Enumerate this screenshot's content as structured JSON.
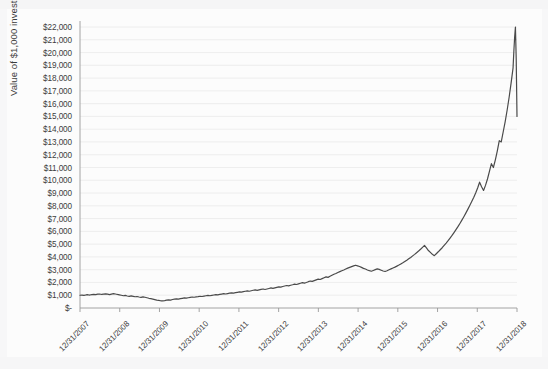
{
  "chart_data": {
    "type": "line",
    "title": "",
    "xlabel": "",
    "ylabel": "Value of $1,000 investment",
    "ylim": [
      0,
      22000
    ],
    "grid": true,
    "legend": false,
    "y_tick_labels": [
      "$22,000",
      "$21,000",
      "$20,000",
      "$19,000",
      "$18,000",
      "$17,000",
      "$16,000",
      "$15,000",
      "$14,000",
      "$13,000",
      "$12,000",
      "$11,000",
      "$10,000",
      "$9,000",
      "$8,000",
      "$7,000",
      "$6,000",
      "$5,000",
      "$4,000",
      "$3,000",
      "$2,000",
      "$1,000",
      "$-"
    ],
    "y_tick_values": [
      22000,
      21000,
      20000,
      19000,
      18000,
      17000,
      16000,
      15000,
      14000,
      13000,
      12000,
      11000,
      10000,
      9000,
      8000,
      7000,
      6000,
      5000,
      4000,
      3000,
      2000,
      1000,
      0
    ],
    "x_tick_labels": [
      "12/31/2007",
      "12/31/2008",
      "12/31/2009",
      "12/31/2010",
      "12/31/2011",
      "12/31/2012",
      "12/31/2013",
      "12/31/2014",
      "12/31/2015",
      "12/31/2016",
      "12/31/2017",
      "12/31/2018"
    ],
    "x_start": 2007.0,
    "x_end": 2018.1,
    "series_name": "Value of $1,000 investment",
    "line_color": "#4a4a4a",
    "line_width": 1.2,
    "x": [
      2007.0,
      2007.05,
      2007.1,
      2007.15,
      2007.2,
      2007.25,
      2007.3,
      2007.35,
      2007.4,
      2007.45,
      2007.5,
      2007.55,
      2007.6,
      2007.65,
      2007.7,
      2007.75,
      2007.8,
      2007.85,
      2007.9,
      2007.95,
      2008.0,
      2008.05,
      2008.1,
      2008.15,
      2008.2,
      2008.25,
      2008.3,
      2008.35,
      2008.4,
      2008.45,
      2008.5,
      2008.55,
      2008.6,
      2008.65,
      2008.7,
      2008.75,
      2008.8,
      2008.85,
      2008.9,
      2008.95,
      2009.0,
      2009.05,
      2009.1,
      2009.15,
      2009.2,
      2009.25,
      2009.3,
      2009.35,
      2009.4,
      2009.45,
      2009.5,
      2009.55,
      2009.6,
      2009.65,
      2009.7,
      2009.75,
      2009.8,
      2009.85,
      2009.9,
      2009.95,
      2010.0,
      2010.05,
      2010.1,
      2010.15,
      2010.2,
      2010.25,
      2010.3,
      2010.35,
      2010.4,
      2010.45,
      2010.5,
      2010.55,
      2010.6,
      2010.65,
      2010.7,
      2010.75,
      2010.8,
      2010.85,
      2010.9,
      2010.95,
      2011.0,
      2011.05,
      2011.1,
      2011.15,
      2011.2,
      2011.25,
      2011.3,
      2011.35,
      2011.4,
      2011.45,
      2011.5,
      2011.55,
      2011.6,
      2011.65,
      2011.7,
      2011.75,
      2011.8,
      2011.85,
      2011.9,
      2011.95,
      2012.0,
      2012.05,
      2012.1,
      2012.15,
      2012.2,
      2012.25,
      2012.3,
      2012.35,
      2012.4,
      2012.45,
      2012.5,
      2012.55,
      2012.6,
      2012.65,
      2012.7,
      2012.75,
      2012.8,
      2012.85,
      2012.9,
      2012.95,
      2013.0,
      2013.05,
      2013.1,
      2013.15,
      2013.2,
      2013.25,
      2013.3,
      2013.35,
      2013.4,
      2013.45,
      2013.5,
      2013.55,
      2013.6,
      2013.65,
      2013.7,
      2013.75,
      2013.8,
      2013.85,
      2013.9,
      2013.95,
      2014.0,
      2014.05,
      2014.1,
      2014.15,
      2014.2,
      2014.25,
      2014.3,
      2014.35,
      2014.4,
      2014.45,
      2014.5,
      2014.55,
      2014.6,
      2014.65,
      2014.7,
      2014.75,
      2014.8,
      2014.85,
      2014.9,
      2014.95,
      2015.0,
      2015.05,
      2015.1,
      2015.15,
      2015.2,
      2015.25,
      2015.3,
      2015.35,
      2015.4,
      2015.45,
      2015.5,
      2015.55,
      2015.6,
      2015.65,
      2015.7,
      2015.75,
      2015.8,
      2015.85,
      2015.9,
      2015.95,
      2016.0,
      2016.05,
      2016.1,
      2016.15,
      2016.2,
      2016.25,
      2016.3,
      2016.35,
      2016.4,
      2016.45,
      2016.5,
      2016.55,
      2016.6,
      2016.65,
      2016.7,
      2016.75,
      2016.8,
      2016.85,
      2016.9,
      2016.95,
      2017.0,
      2017.05,
      2017.1,
      2017.15,
      2017.2,
      2017.25,
      2017.3,
      2017.35,
      2017.4,
      2017.45,
      2017.5,
      2017.55,
      2017.6,
      2017.65,
      2017.7,
      2017.75,
      2017.8,
      2017.85,
      2017.9,
      2017.95,
      2018.0,
      2018.02,
      2018.04,
      2018.06,
      2018.08,
      2018.1
    ],
    "values": [
      1000,
      1010,
      990,
      1020,
      1040,
      1015,
      1050,
      1070,
      1045,
      1080,
      1095,
      1060,
      1085,
      1110,
      1080,
      1050,
      1090,
      1120,
      1095,
      1060,
      1030,
      1000,
      960,
      985,
      940,
      910,
      950,
      915,
      880,
      900,
      860,
      830,
      870,
      840,
      800,
      760,
      730,
      700,
      660,
      620,
      600,
      565,
      555,
      580,
      610,
      640,
      620,
      665,
      700,
      720,
      690,
      730,
      760,
      790,
      770,
      800,
      830,
      860,
      840,
      870,
      890,
      920,
      900,
      935,
      960,
      985,
      960,
      990,
      1020,
      1050,
      1030,
      1060,
      1090,
      1120,
      1095,
      1130,
      1160,
      1190,
      1170,
      1200,
      1230,
      1260,
      1240,
      1280,
      1310,
      1340,
      1310,
      1350,
      1390,
      1420,
      1380,
      1420,
      1460,
      1490,
      1450,
      1490,
      1530,
      1570,
      1540,
      1580,
      1620,
      1660,
      1630,
      1680,
      1720,
      1760,
      1730,
      1780,
      1820,
      1870,
      1840,
      1890,
      1940,
      1990,
      1950,
      2000,
      2060,
      2110,
      2080,
      2140,
      2200,
      2260,
      2230,
      2300,
      2370,
      2440,
      2400,
      2480,
      2560,
      2640,
      2700,
      2780,
      2850,
      2920,
      2980,
      3050,
      3120,
      3180,
      3240,
      3300,
      3350,
      3300,
      3250,
      3180,
      3100,
      3050,
      2980,
      2920,
      2880,
      2940,
      3000,
      3060,
      3020,
      2960,
      2900,
      2860,
      2920,
      2990,
      3060,
      3130,
      3200,
      3280,
      3360,
      3450,
      3540,
      3640,
      3740,
      3850,
      3960,
      4080,
      4200,
      4330,
      4460,
      4600,
      4750,
      4900,
      4700,
      4500,
      4350,
      4200,
      4100,
      4250,
      4400,
      4560,
      4720,
      4900,
      5080,
      5270,
      5470,
      5680,
      5900,
      6130,
      6370,
      6620,
      6880,
      7150,
      7430,
      7720,
      8020,
      8330,
      8650,
      9000,
      9400,
      9850,
      9500,
      9200,
      9600,
      10100,
      10700,
      11300,
      11000,
      11600,
      12300,
      13100,
      13000,
      13800,
      14600,
      15500,
      16500,
      17600,
      18800,
      20100,
      21200,
      22000,
      19500,
      15000
    ]
  }
}
